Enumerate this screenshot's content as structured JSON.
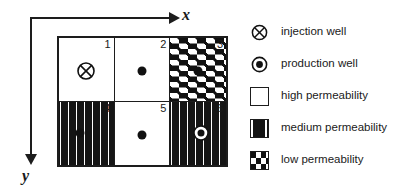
{
  "figure": {
    "axes": {
      "x_label": "x",
      "y_label": "y",
      "x_direction": "right",
      "y_direction": "down",
      "origin_position": "top-left"
    },
    "grid": {
      "columns": 3,
      "rows": 2,
      "cells": [
        {
          "number": "1",
          "permeability": "high",
          "well": "injection-well",
          "well_x": 50,
          "well_y": 52
        },
        {
          "number": "2",
          "permeability": "high",
          "well": "dot",
          "well_x": 50,
          "well_y": 52
        },
        {
          "number": "3",
          "permeability": "low",
          "well": "dot",
          "well_x": 50,
          "well_y": 52
        },
        {
          "number": "4",
          "permeability": "medium",
          "well": "dot",
          "well_x": 38,
          "well_y": 50
        },
        {
          "number": "5",
          "permeability": "high",
          "well": "dot",
          "well_x": 50,
          "well_y": 52
        },
        {
          "number": "6",
          "permeability": "medium",
          "well": "production-well",
          "well_x": 55,
          "well_y": 50
        }
      ]
    },
    "legend": {
      "items": [
        {
          "symbol": "injection-well",
          "label": "injection well"
        },
        {
          "symbol": "production-well",
          "label": "production well"
        },
        {
          "symbol": "swatch-high",
          "label": "high permeability"
        },
        {
          "symbol": "swatch-medium",
          "label": "medium permeability"
        },
        {
          "symbol": "swatch-low",
          "label": "low permeability"
        }
      ]
    },
    "colors": {
      "ink": "#1a1a1a",
      "line": "#1d1d1d",
      "background": "#ffffff",
      "pattern_fill": "#111111"
    }
  }
}
